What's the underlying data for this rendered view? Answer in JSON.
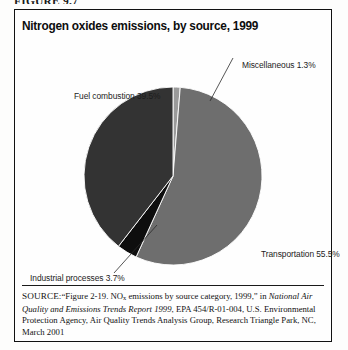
{
  "figure": {
    "label": "FIGURE 9.7",
    "title": "Nitrogen oxides emissions, by source, 1999"
  },
  "labels": {
    "misc": "Miscellaneous 1.3%",
    "fuel": "Fuel combustion 39.5%",
    "transportation": "Transportation 55.5%",
    "industrial": "Industrial processes 3.7%"
  },
  "source": {
    "prefix": "SOURCE:",
    "text_1": "“Figure 2-19. NO",
    "subscript": "x",
    "text_2": " emissions by source category, 1999,” in ",
    "italic_title": "National Air Quality and Emissions Trends Report 1999",
    "text_3": ", EPA 454/R-01-004, U.S. Environmental Protection Agency, Air Quality Trends Analysis Group, Research Triangle Park, NC, March 2001"
  },
  "chart_data": {
    "type": "pie",
    "title": "Nitrogen oxides emissions, by source, 1999",
    "unit": "percent of total NOx emissions",
    "categories": [
      "Miscellaneous",
      "Transportation",
      "Industrial processes",
      "Fuel combustion"
    ],
    "values": [
      1.3,
      55.5,
      3.7,
      39.5
    ],
    "colors": [
      "#9a9a9a",
      "#6e6e6e",
      "#0e0e0e",
      "#333333"
    ],
    "start_angle_deg": 0,
    "direction": "clockwise",
    "legend": "none",
    "labels_position": "external",
    "leader_lines": [
      "Miscellaneous",
      "Industrial processes"
    ],
    "slices": [
      {
        "name": "Miscellaneous",
        "value": 1.3,
        "label": "Miscellaneous 1.3%",
        "color": "#9a9a9a"
      },
      {
        "name": "Transportation",
        "value": 55.5,
        "label": "Transportation 55.5%",
        "color": "#6e6e6e"
      },
      {
        "name": "Industrial processes",
        "value": 3.7,
        "label": "Industrial processes 3.7%",
        "color": "#0e0e0e"
      },
      {
        "name": "Fuel combustion",
        "value": 39.5,
        "label": "Fuel combustion 39.5%",
        "color": "#333333"
      }
    ]
  }
}
